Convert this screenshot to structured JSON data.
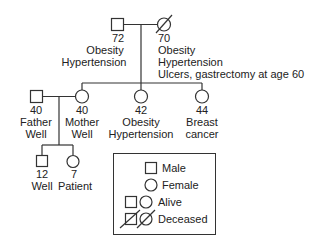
{
  "diagram": {
    "type": "pedigree",
    "generation1": {
      "grandfather": {
        "sex": "male",
        "status": "alive",
        "age": "72",
        "notes": [
          "Obesity",
          "Hypertension"
        ]
      },
      "grandmother": {
        "sex": "female",
        "status": "deceased",
        "age": "70",
        "notes": [
          "Obesity",
          "Hypertension",
          "Ulcers, gastrectomy at age 60"
        ]
      }
    },
    "generation2": {
      "father": {
        "sex": "male",
        "status": "alive",
        "age": "40",
        "notes": [
          "Father",
          "Well"
        ]
      },
      "mother": {
        "sex": "female",
        "status": "alive",
        "age": "40",
        "notes": [
          "Mother",
          "Well"
        ]
      },
      "aunt1": {
        "sex": "female",
        "status": "alive",
        "age": "42",
        "notes": [
          "Obesity",
          "Hypertension"
        ]
      },
      "aunt2": {
        "sex": "female",
        "status": "alive",
        "age": "44",
        "notes": [
          "Breast",
          "cancer"
        ]
      }
    },
    "generation3": {
      "son": {
        "sex": "male",
        "status": "alive",
        "age": "12",
        "notes": [
          "Well"
        ]
      },
      "daughter": {
        "sex": "female",
        "status": "alive",
        "age": "7",
        "notes": [
          "Patient"
        ]
      }
    },
    "legend": {
      "male": "Male",
      "female": "Female",
      "alive": "Alive",
      "deceased": "Deceased"
    },
    "colors": {
      "line": "#333333",
      "text": "#222222",
      "background": "#ffffff"
    }
  }
}
